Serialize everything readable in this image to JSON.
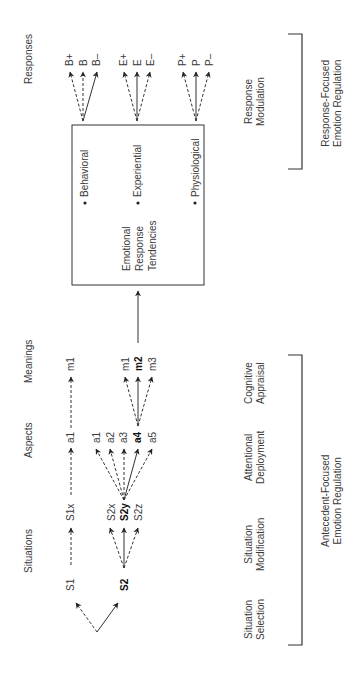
{
  "columns": {
    "responses": "Responses",
    "meanings": "Meanings",
    "aspects": "Aspects",
    "situations": "Situations"
  },
  "box": {
    "items": [
      "Behavioral",
      "Experiential",
      "Physiological"
    ],
    "title_lines": [
      "Emotional",
      "Response",
      "Tendencies"
    ]
  },
  "responses": {
    "behavioral": [
      "B+",
      "B",
      "B–"
    ],
    "experiential": [
      "E+",
      "E",
      "E–"
    ],
    "physiological": [
      "P+",
      "P",
      "P–"
    ]
  },
  "meanings": {
    "top": "m1",
    "group": [
      "m1",
      "m2",
      "m3"
    ],
    "selected": "m2"
  },
  "aspects": {
    "top": "a1",
    "group": [
      "a1",
      "a2",
      "a3",
      "a4",
      "a5"
    ],
    "selected": "a4"
  },
  "situations": {
    "s1": "S1",
    "s1x": "S1x",
    "s2": "S2",
    "s2_mods": [
      "S2x",
      "S2y",
      "S2z"
    ],
    "selected_mod": "S2y"
  },
  "stages": {
    "response_modulation": [
      "Response",
      "Modulation"
    ],
    "cognitive_appraisal": [
      "Cognitive",
      "Appraisal"
    ],
    "attentional_deployment": [
      "Attentional",
      "Deployment"
    ],
    "situation_modification": [
      "Situation",
      "Modification"
    ],
    "situation_selection": [
      "Situation",
      "Selection"
    ]
  },
  "brackets": {
    "response_focused": [
      "Response-Focused",
      "Emotion Regulation"
    ],
    "antecedent_focused": [
      "Antecedent-Focused",
      "Emotion Regulation"
    ]
  }
}
